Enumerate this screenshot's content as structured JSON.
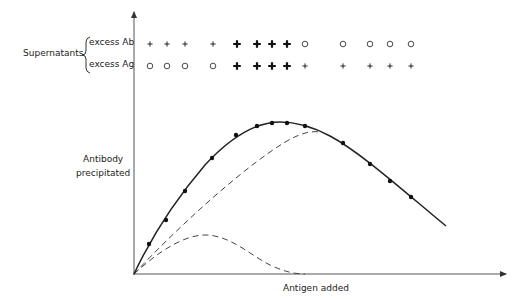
{
  "figure": {
    "supernatants_label": "Supernatants",
    "row_labels": [
      "excess Ab",
      "excess Ag"
    ],
    "ylabel_line1": "Antibody",
    "ylabel_line2": "precipitated",
    "xlabel": "Antigen added"
  },
  "chart_data": {
    "type": "line",
    "title": "",
    "xlabel": "Antigen added",
    "ylabel": "Antibody precipitated",
    "grid": false,
    "ticks": "none",
    "series": [
      {
        "name": "Total antibody precipitated (measured)",
        "style": "solid with dots",
        "x": [
          0,
          1,
          2,
          3,
          4,
          5,
          6,
          7,
          8,
          9,
          10,
          11,
          12,
          13
        ],
        "x_px": [
          149,
          166,
          185,
          212,
          236,
          257,
          272,
          287,
          305,
          343,
          370,
          390,
          411
        ],
        "points_px": [
          [
            149,
            244
          ],
          [
            166,
            220
          ],
          [
            185,
            191
          ],
          [
            212,
            158
          ],
          [
            236,
            135
          ],
          [
            257,
            126
          ],
          [
            272,
            123
          ],
          [
            287,
            123
          ],
          [
            305,
            126
          ],
          [
            343,
            143
          ],
          [
            370,
            164
          ],
          [
            390,
            181
          ],
          [
            411,
            197
          ]
        ],
        "curve_end_px": [
          446,
          226
        ]
      },
      {
        "name": "Precipitate component (large dashed)",
        "style": "dashed",
        "path_px": [
          [
            134,
            274
          ],
          [
            200,
            210
          ],
          [
            260,
            160
          ],
          [
            300,
            136
          ],
          [
            318,
            132
          ]
        ]
      },
      {
        "name": "Precipitate component (small dashed)",
        "style": "dashed",
        "path_px": [
          [
            134,
            274
          ],
          [
            170,
            245
          ],
          [
            205,
            235
          ],
          [
            240,
            245
          ],
          [
            270,
            265
          ],
          [
            300,
            274
          ]
        ]
      }
    ],
    "supernatant_tests": {
      "x_px": [
        150,
        167,
        185,
        213,
        237,
        257,
        272,
        287,
        305,
        343,
        370,
        390,
        411
      ],
      "excess_Ab": [
        "+",
        "+",
        "+",
        "+",
        "✚",
        "✚",
        "✚",
        "✚",
        "o",
        "o",
        "o",
        "o",
        "o"
      ],
      "excess_Ag": [
        "o",
        "o",
        "o",
        "o",
        "✚",
        "✚",
        "✚",
        "✚",
        "+",
        "+",
        "+",
        "+",
        "+"
      ],
      "legend": {
        "+": "small plus (positive)",
        "✚": "bold plus (strong positive)",
        "o": "circle (negative)"
      }
    },
    "axes": {
      "origin_px": [
        134,
        274
      ],
      "x_end_px": [
        508,
        274
      ],
      "y_end_px": [
        134,
        10
      ]
    }
  }
}
